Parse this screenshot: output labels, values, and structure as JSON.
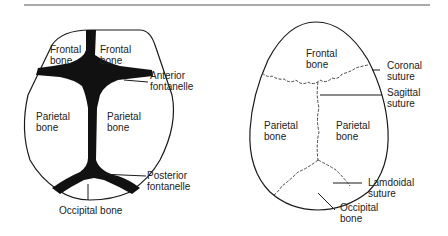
{
  "left_diagram": {
    "title": "Infant skull (fontanelles)",
    "labels": {
      "frontal_left": "Frontal\nbone",
      "frontal_right": "Frontal\nbone",
      "anterior_fontanelle": "Anterior\nfontanelle",
      "parietal_left": "Parietal\nbone",
      "parietal_right": "Parietal\nbone",
      "posterior_fontanelle": "Posterior\nfontanelle",
      "occipital": "Occipital bone"
    }
  },
  "right_diagram": {
    "title": "Adult skull (sutures)",
    "labels": {
      "frontal": "Frontal\nbone",
      "coronal_suture": "Coronal\nsuture",
      "sagittal_suture": "Sagittal\nsuture",
      "parietal_left": "Parietal\nbone",
      "parietal_right": "Parietal\nbone",
      "lamdoidal_suture": "Lamdoidal\nsuture",
      "occipital": "Occipital\nbone"
    }
  },
  "colors": {
    "line": "#1a1a1a",
    "rule": "#555555"
  }
}
